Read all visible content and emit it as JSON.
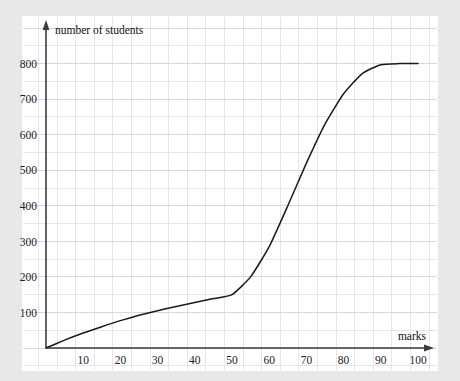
{
  "figure": {
    "background_color": "#e8e8e8",
    "paper_color": "#ffffff",
    "grid_minor_color": "#e6e4ee",
    "grid_major_color": "#d7d5e2",
    "axis_color": "#3a3a3a",
    "curve_color": "#1a1a1a"
  },
  "chart_data": {
    "type": "line",
    "title": "",
    "subtitle": "",
    "xlabel": "marks",
    "ylabel": "number of students",
    "xlim": [
      0,
      105
    ],
    "ylim": [
      0,
      860
    ],
    "grid": true,
    "legend": null,
    "x_ticks": [
      10,
      20,
      30,
      40,
      50,
      60,
      70,
      80,
      90,
      100
    ],
    "x_tick_labels": [
      "10",
      "20",
      "30",
      "40",
      "50",
      "60",
      "70",
      "80",
      "90",
      "100"
    ],
    "y_ticks": [
      100,
      200,
      300,
      400,
      500,
      600,
      700,
      800
    ],
    "y_tick_labels": [
      "100",
      "200",
      "300",
      "400",
      "500",
      "600",
      "700",
      "800"
    ],
    "x_minor_step": 5,
    "y_minor_step": 50,
    "series": [
      {
        "name": "cumulative frequency",
        "x": [
          0,
          5,
          10,
          15,
          20,
          25,
          30,
          35,
          40,
          45,
          50,
          55,
          60,
          65,
          70,
          75,
          80,
          85,
          90,
          95,
          100
        ],
        "y": [
          0,
          22,
          42,
          60,
          77,
          92,
          105,
          117,
          128,
          139,
          150,
          200,
          285,
          400,
          520,
          630,
          715,
          772,
          797,
          800,
          800
        ]
      }
    ],
    "annotations": [
      {
        "text": "number of students",
        "position": "y-axis-top"
      },
      {
        "text": "marks",
        "position": "x-axis-right"
      }
    ],
    "axis_arrows": {
      "x": true,
      "y": true
    }
  },
  "axis_labels": {
    "y_axis_title": "number of students",
    "x_axis_title": "marks"
  }
}
